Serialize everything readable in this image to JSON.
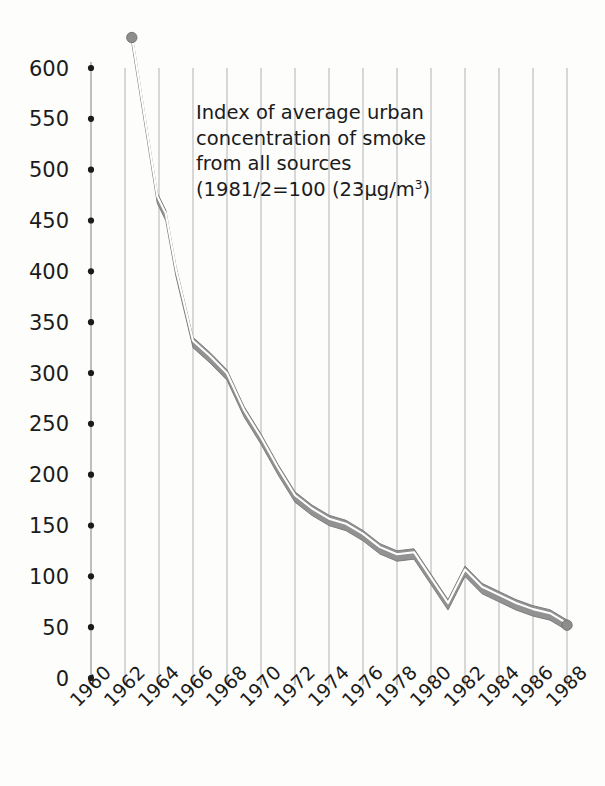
{
  "chart_data": {
    "type": "line",
    "title": "",
    "annotation": {
      "lines": [
        "Index of average urban",
        "concentration of smoke",
        "from all sources"
      ],
      "line4_prefix": "(1981/2=100 (23",
      "line4_mu": "μ",
      "line4_mid": "g/m",
      "line4_sup": "3",
      "line4_suffix": ")"
    },
    "xlabel": "",
    "ylabel": "",
    "xlim": [
      1960,
      1989
    ],
    "ylim": [
      0,
      600
    ],
    "ytick_labels": [
      "600",
      "550",
      "500",
      "450",
      "400",
      "350",
      "300",
      "250",
      "200",
      "150",
      "100",
      "50",
      "0"
    ],
    "ytick_values": [
      600,
      550,
      500,
      450,
      400,
      350,
      300,
      250,
      200,
      150,
      100,
      50,
      0
    ],
    "xtick_labels": [
      "1960",
      "1962",
      "1964",
      "1966",
      "1968",
      "1970",
      "1972",
      "1974",
      "1976",
      "1978",
      "1980",
      "1982",
      "1984",
      "1986",
      "1988"
    ],
    "xtick_values": [
      1960,
      1962,
      1964,
      1966,
      1968,
      1970,
      1972,
      1974,
      1976,
      1978,
      1980,
      1982,
      1984,
      1986,
      1988
    ],
    "grid": "vertical",
    "legend": "none",
    "series": [
      {
        "name": "Index of average urban concentration of smoke from all sources",
        "x": [
          1962.4,
          1963.9,
          1964.4,
          1965.0,
          1966.0,
          1967.0,
          1968.0,
          1969.0,
          1970.0,
          1971.0,
          1972.0,
          1973.0,
          1974.0,
          1975.0,
          1976.0,
          1977.0,
          1978.0,
          1979.0,
          1980.0,
          1981.0,
          1982.0,
          1983.0,
          1984.0,
          1985.0,
          1986.0,
          1987.0,
          1988.0
        ],
        "values": [
          630,
          472,
          455,
          400,
          330,
          315,
          298,
          262,
          235,
          205,
          178,
          165,
          155,
          150,
          140,
          127,
          120,
          122,
          97,
          72,
          105,
          88,
          80,
          72,
          66,
          62,
          52
        ]
      }
    ]
  },
  "style": {
    "line_fill": "#8d8d8d",
    "line_highlight": "#ffffff",
    "line_edge": "#6f6f6f",
    "grid_color": "#b9b9b9",
    "axis_color": "#8a8a8a",
    "tick_dot_color": "#1b1b1b",
    "background": "#fdfdfc",
    "text_color": "#1b1b1b"
  },
  "geometry": {
    "plot_left": 91,
    "plot_right": 585,
    "plot_top": 30,
    "plot_bottom": 678,
    "y_zero_px": 678,
    "y_max_px": 68,
    "y_max_value": 600,
    "x_start_year": 1960,
    "px_per_year": 17.0,
    "ribbon_half_width": 5.2
  }
}
